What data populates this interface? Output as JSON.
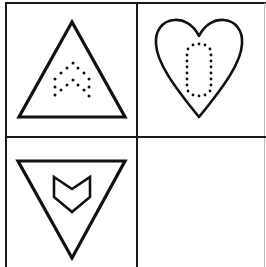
{
  "worksheet": {
    "grid": {
      "rows": 2,
      "cols": 2,
      "line_color": "#1a1a1a",
      "background": "#ffffff"
    },
    "cells": [
      {
        "position": "top-left",
        "outer_shape": "triangle-up",
        "inner_pattern": "dotted-double-chevron-up",
        "inner_style": "dotted"
      },
      {
        "position": "top-right",
        "outer_shape": "heart",
        "inner_pattern": "dotted-rounded-rectangle",
        "inner_style": "dotted"
      },
      {
        "position": "bottom-left",
        "outer_shape": "triangle-down",
        "inner_pattern": "chevron-down-outline",
        "inner_style": "solid"
      },
      {
        "position": "bottom-right",
        "outer_shape": "empty",
        "inner_pattern": "none",
        "inner_style": "none"
      }
    ]
  }
}
